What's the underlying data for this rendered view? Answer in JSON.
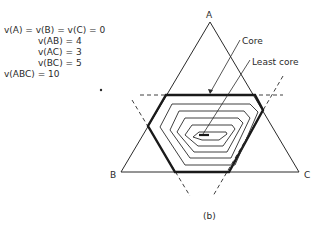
{
  "equations": [
    "v(A) = v(B) = v(C) = 0",
    "v(AB) = 4",
    "v(AC) = 3",
    "v(BC) = 5",
    "v(ABC) = 10"
  ],
  "diagram": {
    "vertex_labels": {
      "a": "A",
      "b": "B",
      "c": "C"
    },
    "annotations": {
      "core": "Core",
      "least_core": "Least core"
    },
    "caption": "(b)"
  },
  "colors": {
    "ink": "#2a2a2a",
    "background": "#ffffff"
  }
}
